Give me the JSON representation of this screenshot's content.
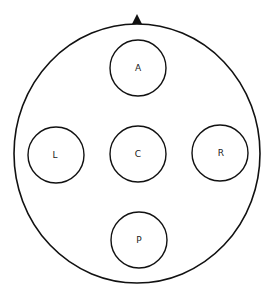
{
  "diagram": {
    "type": "electrode/position layout",
    "colors": {
      "stroke": "#111111",
      "background": "#ffffff",
      "marker": "#111111"
    },
    "outer_circle": {
      "cx": 137,
      "cy": 153.5,
      "rx": 123,
      "ry": 129.5
    },
    "orientation_marker": {
      "shape": "triangle",
      "tip": [
        137,
        14
      ],
      "base_left": [
        132,
        24
      ],
      "base_right": [
        142,
        24
      ]
    },
    "positions": [
      {
        "id": "anterior",
        "label": "A",
        "cx": 138,
        "cy": 68,
        "r": 28
      },
      {
        "id": "left",
        "label": "L",
        "cx": 56,
        "cy": 155,
        "r": 28
      },
      {
        "id": "center",
        "label": "C",
        "cx": 138,
        "cy": 154,
        "r": 28
      },
      {
        "id": "right",
        "label": "R",
        "cx": 220,
        "cy": 153,
        "r": 28
      },
      {
        "id": "posterior",
        "label": "P",
        "cx": 139,
        "cy": 240,
        "r": 28
      }
    ]
  }
}
